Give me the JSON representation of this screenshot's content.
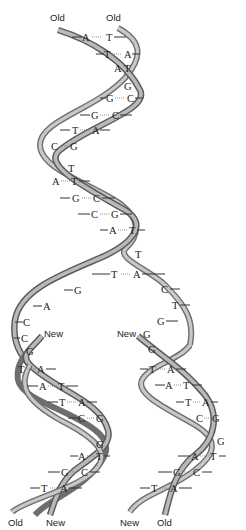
{
  "diagram": {
    "parent": {
      "labels": {
        "left": "Old",
        "right": "Old"
      },
      "pairs": [
        {
          "left": "A",
          "right": "T"
        },
        {
          "left": "T",
          "right": "A"
        },
        {
          "left": "A",
          "right": "T"
        },
        {
          "left": "",
          "right": "G"
        },
        {
          "left": "G",
          "right": "C"
        },
        {
          "left": "G",
          "right": "C"
        },
        {
          "left": "T",
          "right": "A"
        },
        {
          "left": "C",
          "right": "G"
        },
        {
          "left": "",
          "right": "T"
        },
        {
          "left": "A",
          "right": "T"
        },
        {
          "left": "G",
          "right": "C"
        },
        {
          "left": "C",
          "right": "G"
        },
        {
          "left": "A",
          "right": "T"
        },
        {
          "left": "",
          "right": "T"
        },
        {
          "left": "T",
          "right": "A"
        }
      ]
    },
    "fork": {
      "left_unpaired": [
        "G",
        "A",
        "C",
        "C"
      ],
      "right_unpaired": [
        "C",
        "T",
        "G"
      ]
    },
    "daughter_left": {
      "labels": {
        "new_top": "New",
        "bottom_left": "Old",
        "bottom_right": "New"
      },
      "pairs": [
        {
          "left": "",
          "right": "G"
        },
        {
          "left": "T",
          "right": "A"
        },
        {
          "left": "A",
          "right": "T"
        },
        {
          "left": "T",
          "right": "A"
        },
        {
          "left": "C",
          "right": "G"
        },
        {
          "left": "",
          "right": "G"
        },
        {
          "left": "A",
          "right": "T"
        },
        {
          "left": "G",
          "right": "C"
        },
        {
          "left": "T",
          "right": "A"
        }
      ]
    },
    "daughter_right": {
      "labels": {
        "new_top": "New",
        "bottom_left": "New",
        "bottom_right": "Old"
      },
      "pairs": [
        {
          "left": "G",
          "right": ""
        },
        {
          "left": "",
          "right": "G"
        },
        {
          "left": "T",
          "right": "A"
        },
        {
          "left": "A",
          "right": "T"
        },
        {
          "left": "T",
          "right": "A"
        },
        {
          "left": "C",
          "right": "G"
        },
        {
          "left": "",
          "right": "G"
        },
        {
          "left": "A",
          "right": "T"
        },
        {
          "left": "G",
          "right": "C"
        },
        {
          "left": "T",
          "right": "A"
        }
      ]
    },
    "colors": {
      "strand_edge": "#5a5a5a",
      "strand_fill": "#bdbdbd",
      "text": "#222222",
      "background": "#ffffff"
    }
  }
}
